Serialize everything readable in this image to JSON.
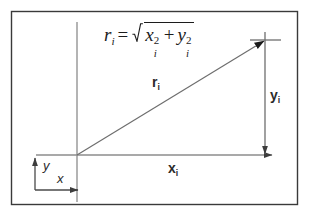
{
  "figure": {
    "name": "polar-radius-diagram",
    "background_color": "#ffffff",
    "frame_color": "#3a3a3a",
    "line_color": "#8c8c8c",
    "text_color": "#2b2b2b",
    "formula_color": "#1c1c1c"
  },
  "formula": {
    "lhs_var": "r",
    "lhs_sub": "i",
    "equals": "=",
    "term1_var": "x",
    "term1_sub": "i",
    "term1_sup": "2",
    "plus": "+",
    "term2_var": "y",
    "term2_sub": "i",
    "term2_sup": "2",
    "plain_text": "r_i = sqrt(x_i^2 + y_i^2)"
  },
  "labels": {
    "radius": {
      "base": "r",
      "sub": "i"
    },
    "x_component": {
      "base": "x",
      "sub": "i"
    },
    "y_component": {
      "base": "y",
      "sub": "i"
    },
    "axis_x": "x",
    "axis_y": "y"
  },
  "geometry": {
    "frame": {
      "x": 11,
      "y": 11,
      "width": 287,
      "height": 194
    },
    "origin": {
      "x": 77,
      "y": 155
    },
    "point": {
      "x": 265,
      "y": 40
    },
    "vertical_axis": {
      "x": 77,
      "y_top": 22,
      "y_bottom": 202
    },
    "horizontal_axis": {
      "y": 155,
      "x_left": 36,
      "x_right": 273
    },
    "small_axes": {
      "y_arrow": {
        "x": 35,
        "y_bottom": 190,
        "y_top": 156
      },
      "x_arrow": {
        "y": 190,
        "x_left": 35,
        "x_right": 79
      }
    },
    "point_marker": "cross"
  }
}
